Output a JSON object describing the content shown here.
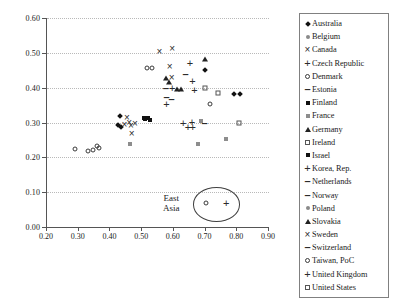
{
  "chart_data": {
    "type": "scatter",
    "title": "",
    "xlabel": "",
    "ylabel": "",
    "xlim": [
      0.2,
      0.9
    ],
    "ylim": [
      0.0,
      0.6
    ],
    "xticks": [
      "0.20",
      "0.30",
      "0.40",
      "0.50",
      "0.60",
      "0.70",
      "0.80",
      "0.90"
    ],
    "yticks": [
      "0.00",
      "0.10",
      "0.20",
      "0.30",
      "0.40",
      "0.50",
      "0.60"
    ],
    "grid": "horizontal-dotted",
    "legend_position": "right-outside",
    "annotations": [
      {
        "text": "East\nAsia",
        "line1": "East",
        "line2": "Asia",
        "x": 0.595,
        "y": 0.068,
        "ellipse": {
          "cx": 0.735,
          "cy": 0.068,
          "rx": 0.072,
          "ry": 0.047
        }
      }
    ],
    "legend": [
      {
        "label": "Australia",
        "marker": "diamond-filled"
      },
      {
        "label": "Belgium",
        "marker": "dot-small"
      },
      {
        "label": "Canada",
        "marker": "x-mark"
      },
      {
        "label": "Czech Republic",
        "marker": "plus"
      },
      {
        "label": "Denmark",
        "marker": "circle-open"
      },
      {
        "label": "Estonia",
        "marker": "dash"
      },
      {
        "label": "Finland",
        "marker": "square-filled"
      },
      {
        "label": "France",
        "marker": "square-small"
      },
      {
        "label": "Germany",
        "marker": "triangle-filled"
      },
      {
        "label": "Ireland",
        "marker": "square-open"
      },
      {
        "label": "Israel",
        "marker": "square-filled"
      },
      {
        "label": "Korea, Rep.",
        "marker": "plus"
      },
      {
        "label": "Netherlands",
        "marker": "dash"
      },
      {
        "label": "Norway",
        "marker": "dash"
      },
      {
        "label": "Poland",
        "marker": "dot-small"
      },
      {
        "label": "Slovakia",
        "marker": "triangle-filled"
      },
      {
        "label": "Sweden",
        "marker": "x-mark"
      },
      {
        "label": "Switzerland",
        "marker": "dash"
      },
      {
        "label": "Taiwan, PoC",
        "marker": "circle-open"
      },
      {
        "label": "United Kingdom",
        "marker": "plus"
      },
      {
        "label": "United States",
        "marker": "square-open"
      }
    ],
    "points": [
      {
        "series": "Denmark",
        "marker": "circle-open",
        "x": 0.293,
        "y": 0.223
      },
      {
        "series": "Denmark",
        "marker": "circle-open",
        "x": 0.333,
        "y": 0.218
      },
      {
        "series": "Denmark",
        "marker": "circle-open",
        "x": 0.348,
        "y": 0.222
      },
      {
        "series": "Denmark",
        "marker": "circle-open",
        "x": 0.36,
        "y": 0.232
      },
      {
        "series": "Denmark",
        "marker": "circle-open",
        "x": 0.368,
        "y": 0.228
      },
      {
        "series": "Australia",
        "marker": "diamond-filled",
        "x": 0.432,
        "y": 0.318
      },
      {
        "series": "Australia",
        "marker": "diamond-filled",
        "x": 0.428,
        "y": 0.292
      },
      {
        "series": "Australia",
        "marker": "diamond-filled",
        "x": 0.438,
        "y": 0.288
      },
      {
        "series": "Canada",
        "marker": "x-mark",
        "x": 0.455,
        "y": 0.312
      },
      {
        "series": "Sweden",
        "marker": "x-mark",
        "x": 0.447,
        "y": 0.294
      },
      {
        "series": "Sweden",
        "marker": "x-mark",
        "x": 0.462,
        "y": 0.299
      },
      {
        "series": "Sweden",
        "marker": "x-mark",
        "x": 0.468,
        "y": 0.291
      },
      {
        "series": "Canada",
        "marker": "x-mark",
        "x": 0.48,
        "y": 0.296
      },
      {
        "series": "Sweden",
        "marker": "x-mark",
        "x": 0.47,
        "y": 0.268
      },
      {
        "series": "Belgium",
        "marker": "dot-small",
        "x": 0.45,
        "y": 0.29
      },
      {
        "series": "Belgium",
        "marker": "dot-small",
        "x": 0.443,
        "y": 0.262
      },
      {
        "series": "Belgium",
        "marker": "dot-small",
        "x": 0.462,
        "y": 0.284
      },
      {
        "series": "Belgium",
        "marker": "dot-small",
        "x": 0.478,
        "y": 0.288
      },
      {
        "series": "France",
        "marker": "square-small",
        "x": 0.466,
        "y": 0.238
      },
      {
        "series": "Israel",
        "marker": "square-filled",
        "x": 0.508,
        "y": 0.314
      },
      {
        "series": "Israel",
        "marker": "square-filled",
        "x": 0.512,
        "y": 0.31
      },
      {
        "series": "Finland",
        "marker": "square-filled",
        "x": 0.522,
        "y": 0.312
      },
      {
        "series": "Finland",
        "marker": "square-filled",
        "x": 0.527,
        "y": 0.306
      },
      {
        "series": "Denmark",
        "marker": "circle-open",
        "x": 0.52,
        "y": 0.456
      },
      {
        "series": "Denmark",
        "marker": "circle-open",
        "x": 0.535,
        "y": 0.456
      },
      {
        "series": "Canada",
        "marker": "x-mark",
        "x": 0.558,
        "y": 0.503
      },
      {
        "series": "Sweden",
        "marker": "x-mark",
        "x": 0.598,
        "y": 0.512
      },
      {
        "series": "Canada",
        "marker": "x-mark",
        "x": 0.59,
        "y": 0.458
      },
      {
        "series": "Sweden",
        "marker": "x-mark",
        "x": 0.596,
        "y": 0.428
      },
      {
        "series": "Germany",
        "marker": "triangle-filled",
        "x": 0.578,
        "y": 0.428
      },
      {
        "series": "Slovakia",
        "marker": "triangle-filled",
        "x": 0.588,
        "y": 0.415
      },
      {
        "series": "Estonia",
        "marker": "dash",
        "x": 0.578,
        "y": 0.4
      },
      {
        "series": "Czech Republic",
        "marker": "plus",
        "x": 0.598,
        "y": 0.398
      },
      {
        "series": "Slovakia",
        "marker": "triangle-filled",
        "x": 0.612,
        "y": 0.396
      },
      {
        "series": "Slovakia",
        "marker": "triangle-filled",
        "x": 0.625,
        "y": 0.396
      },
      {
        "series": "Norway",
        "marker": "dash",
        "x": 0.58,
        "y": 0.372
      },
      {
        "series": "Netherlands",
        "marker": "dash",
        "x": 0.596,
        "y": 0.368
      },
      {
        "series": "Poland",
        "marker": "plus",
        "x": 0.58,
        "y": 0.352
      },
      {
        "series": "Switzerland",
        "marker": "dash",
        "x": 0.64,
        "y": 0.44
      },
      {
        "series": "United Kingdom",
        "marker": "plus",
        "x": 0.654,
        "y": 0.47
      },
      {
        "series": "United Kingdom",
        "marker": "plus",
        "x": 0.662,
        "y": 0.418
      },
      {
        "series": "Germany",
        "marker": "triangle-filled",
        "x": 0.7,
        "y": 0.482
      },
      {
        "series": "Australia",
        "marker": "diamond-filled",
        "x": 0.702,
        "y": 0.452
      },
      {
        "series": "Korea, Rep.",
        "marker": "plus",
        "x": 0.668,
        "y": 0.392
      },
      {
        "series": "Ireland",
        "marker": "square-open",
        "x": 0.7,
        "y": 0.4
      },
      {
        "series": "Czech Republic",
        "marker": "plus",
        "x": 0.633,
        "y": 0.3
      },
      {
        "series": "Korea, Rep.",
        "marker": "plus",
        "x": 0.66,
        "y": 0.302
      },
      {
        "series": "United Kingdom",
        "marker": "plus",
        "x": 0.648,
        "y": 0.286
      },
      {
        "series": "Poland",
        "marker": "plus",
        "x": 0.663,
        "y": 0.288
      },
      {
        "series": "Belgium",
        "marker": "dot-small",
        "x": 0.642,
        "y": 0.288
      },
      {
        "series": "Norway",
        "marker": "dash",
        "x": 0.7,
        "y": 0.3
      },
      {
        "series": "France",
        "marker": "square-small",
        "x": 0.688,
        "y": 0.305
      },
      {
        "series": "Belgium",
        "marker": "dot-small",
        "x": 0.712,
        "y": 0.3
      },
      {
        "series": "Belgium",
        "marker": "dot-small",
        "x": 0.742,
        "y": 0.3
      },
      {
        "series": "Belgium",
        "marker": "dot-small",
        "x": 0.722,
        "y": 0.268
      },
      {
        "series": "Belgium",
        "marker": "dot-small",
        "x": 0.678,
        "y": 0.262
      },
      {
        "series": "France",
        "marker": "square-small",
        "x": 0.678,
        "y": 0.238
      },
      {
        "series": "Taiwan, PoC",
        "marker": "circle-open",
        "x": 0.718,
        "y": 0.352
      },
      {
        "series": "United States",
        "marker": "square-open",
        "x": 0.742,
        "y": 0.385
      },
      {
        "series": "Australia",
        "marker": "diamond-filled",
        "x": 0.792,
        "y": 0.382
      },
      {
        "series": "Australia",
        "marker": "diamond-filled",
        "x": 0.812,
        "y": 0.382
      },
      {
        "series": "United States",
        "marker": "square-open",
        "x": 0.808,
        "y": 0.3
      },
      {
        "series": "Belgium",
        "marker": "dot-small",
        "x": 0.772,
        "y": 0.296
      },
      {
        "series": "France",
        "marker": "square-small",
        "x": 0.768,
        "y": 0.252
      },
      {
        "series": "Taiwan, PoC",
        "marker": "circle-open",
        "x": 0.705,
        "y": 0.068
      },
      {
        "series": "Korea, Rep.",
        "marker": "plus",
        "x": 0.768,
        "y": 0.07
      }
    ]
  }
}
